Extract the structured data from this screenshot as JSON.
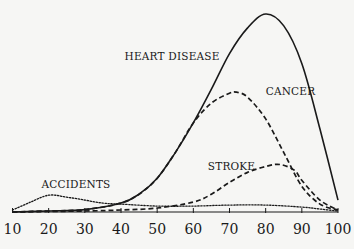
{
  "chart_data": {
    "type": "line",
    "title": "",
    "xlabel": "",
    "ylabel": "",
    "xlim": [
      10,
      100
    ],
    "ylim": [
      0,
      100
    ],
    "grid": false,
    "legend_position": "inline labels",
    "x_ticks": [
      10,
      20,
      30,
      40,
      50,
      60,
      70,
      80,
      90,
      100
    ],
    "series": [
      {
        "name": "HEART DISEASE",
        "style": "solid",
        "label_pos": {
          "x": 41,
          "y": 77
        },
        "points": [
          [
            10,
            0
          ],
          [
            20,
            0.5
          ],
          [
            30,
            1.2
          ],
          [
            40,
            4.5
          ],
          [
            45,
            9
          ],
          [
            50,
            17
          ],
          [
            55,
            30
          ],
          [
            60,
            45
          ],
          [
            65,
            62
          ],
          [
            70,
            80
          ],
          [
            75,
            93
          ],
          [
            80,
            100
          ],
          [
            85,
            94
          ],
          [
            90,
            75
          ],
          [
            95,
            42
          ],
          [
            100,
            6
          ]
        ]
      },
      {
        "name": "CANCER",
        "style": "dashed",
        "label_pos": {
          "x": 80,
          "y": 59
        },
        "points": [
          [
            10,
            0
          ],
          [
            20,
            0.5
          ],
          [
            30,
            1.2
          ],
          [
            40,
            4.5
          ],
          [
            45,
            9
          ],
          [
            50,
            17
          ],
          [
            55,
            30
          ],
          [
            60,
            45
          ],
          [
            65,
            55
          ],
          [
            70,
            60
          ],
          [
            72,
            60.5
          ],
          [
            75,
            58
          ],
          [
            80,
            47
          ],
          [
            85,
            30
          ],
          [
            90,
            13
          ],
          [
            95,
            4
          ],
          [
            100,
            1
          ]
        ]
      },
      {
        "name": "STROKE",
        "style": "dashed",
        "label_pos": {
          "x": 64,
          "y": 21
        },
        "points": [
          [
            10,
            0
          ],
          [
            30,
            0.5
          ],
          [
            40,
            1
          ],
          [
            50,
            2
          ],
          [
            60,
            5
          ],
          [
            65,
            9
          ],
          [
            70,
            15
          ],
          [
            75,
            20
          ],
          [
            80,
            23
          ],
          [
            84,
            24
          ],
          [
            88,
            21
          ],
          [
            90,
            16
          ],
          [
            95,
            6
          ],
          [
            100,
            1
          ]
        ]
      },
      {
        "name": "ACCIDENTS",
        "style": "dotted",
        "label_pos": {
          "x": 18,
          "y": 12
        },
        "points": [
          [
            10,
            1
          ],
          [
            15,
            5
          ],
          [
            20,
            8.5
          ],
          [
            25,
            7.5
          ],
          [
            30,
            6
          ],
          [
            35,
            4.5
          ],
          [
            40,
            4
          ],
          [
            50,
            3
          ],
          [
            60,
            3
          ],
          [
            70,
            3.5
          ],
          [
            80,
            3.5
          ],
          [
            90,
            2.5
          ],
          [
            95,
            1.5
          ],
          [
            100,
            0.5
          ]
        ]
      }
    ]
  }
}
